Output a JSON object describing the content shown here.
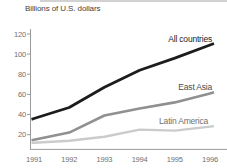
{
  "header": {
    "unit_label": "Billions of U.S. dollars"
  },
  "colors": {
    "background": "#ffffff",
    "axis": "#9b9b9b",
    "tick_text": "#6f6f6f",
    "unit_label_text": "#414141"
  },
  "chart_data": {
    "type": "line",
    "title": "",
    "ylabel": "Billions of U.S. dollars",
    "xlabel": "",
    "x": [
      1991,
      1992,
      1993,
      1994,
      1995,
      1996
    ],
    "yticks": [
      20,
      40,
      60,
      80,
      100,
      120
    ],
    "ylim": [
      0,
      125
    ],
    "grid": false,
    "legend_position": "inline-labels-right",
    "axis_color": "#9b9b9b",
    "series": [
      {
        "name": "All countries",
        "values": [
          36,
          47,
          67,
          84,
          96,
          109
        ],
        "color": "#1c1c1c",
        "label_color": "#1c1c1c"
      },
      {
        "name": "East Asia",
        "values": [
          15,
          22,
          39,
          46,
          52,
          61
        ],
        "color": "#909090",
        "label_color": "#4d4d4d"
      },
      {
        "name": "Latin America",
        "values": [
          12,
          14,
          18,
          25,
          24,
          28
        ],
        "color": "#cbcbcb",
        "label_color": "#707070"
      }
    ]
  }
}
